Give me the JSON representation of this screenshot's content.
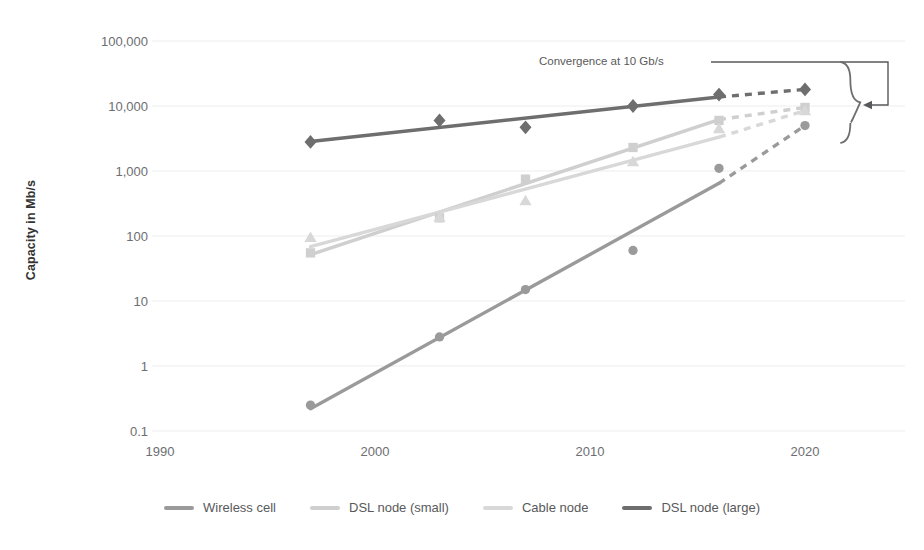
{
  "chart_data": {
    "type": "line",
    "title": "",
    "xlabel": "",
    "ylabel": "Capacity in Mb/s",
    "x_ticks": [
      1990,
      2000,
      2010,
      2020
    ],
    "x_tick_labels": [
      "1990",
      "2000",
      "2010",
      "2020"
    ],
    "xlim": [
      1988,
      2022
    ],
    "y_ticks": [
      0.1,
      1,
      10,
      100,
      1000,
      10000,
      100000
    ],
    "y_tick_labels": [
      "0.1",
      "1",
      "10",
      "100",
      "1,000",
      "10,000",
      "100,000"
    ],
    "ylim": [
      0.1,
      100000
    ],
    "y_scale": "log",
    "grid": "horizontal",
    "legend_position": "bottom",
    "annotations": [
      {
        "text": "Convergence at 10 Gb/s",
        "x": 2012.5,
        "y": 42000,
        "leader": "line right, down, arrow left into brace",
        "brace_label": "convergence-brace"
      }
    ],
    "series": [
      {
        "name": "Wireless cell",
        "color": "#9a9a9a",
        "marker": "circle",
        "x": [
          1997,
          2003,
          2007,
          2012,
          2016,
          2020
        ],
        "values": [
          0.25,
          2.8,
          15,
          60,
          1100,
          5000
        ],
        "solid_through": 2016,
        "projected_from": 2016
      },
      {
        "name": "DSL node (small)",
        "color": "#cfcfcf",
        "marker": "square",
        "x": [
          1997,
          2003,
          2007,
          2012,
          2016,
          2020
        ],
        "values": [
          55,
          190,
          750,
          2300,
          6000,
          9500
        ],
        "solid_through": 2016,
        "projected_from": 2016
      },
      {
        "name": "Cable node",
        "color": "#d8d8d8",
        "marker": "triangle",
        "x": [
          1997,
          2003,
          2007,
          2012,
          2016,
          2020
        ],
        "values": [
          95,
          195,
          350,
          1400,
          4500,
          8500
        ],
        "solid_through": 2016,
        "projected_from": 2016
      },
      {
        "name": "DSL node (large)",
        "color": "#6e6e6e",
        "marker": "diamond",
        "x": [
          1997,
          2003,
          2007,
          2012,
          2016,
          2020
        ],
        "values": [
          2800,
          6000,
          4700,
          10000,
          15000,
          18000
        ],
        "solid_through": 2016,
        "projected_from": 2016
      }
    ]
  },
  "legend": {
    "items": [
      {
        "label": "Wireless cell",
        "color": "#9a9a9a"
      },
      {
        "label": "DSL node (small)",
        "color": "#cfcfcf"
      },
      {
        "label": "Cable node",
        "color": "#d8d8d8"
      },
      {
        "label": "DSL node (large)",
        "color": "#6e6e6e"
      }
    ]
  },
  "axis": {
    "y_title": "Capacity in Mb/s"
  },
  "colors": {
    "grid": "#ededed",
    "tick_text": "#6d6e71",
    "annotation": "#58595b",
    "leader": "#58595b"
  }
}
